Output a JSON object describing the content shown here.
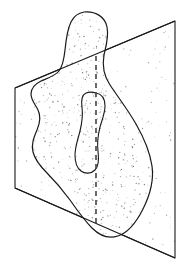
{
  "figure": {
    "title": "Irregular solid intersected by a cutting plane",
    "background_color": "#ffffff",
    "line_color": "#1a1a1a",
    "stipple_color": "#555555",
    "plane_fill": "#ffffff",
    "blob_fill": "#ffffff",
    "stroke_width": 1.1
  },
  "plane": {
    "name": "cutting-plane",
    "shape": "parallelogram",
    "corners": [
      {
        "label": "top-left",
        "x": 15,
        "y": 88
      },
      {
        "label": "top-right",
        "x": 175,
        "y": 21
      },
      {
        "label": "bottom-right",
        "x": 175,
        "y": 258
      },
      {
        "label": "bottom-left",
        "x": 15,
        "y": 188
      }
    ],
    "edges": [
      {
        "label": "top-edge",
        "from": "top-left",
        "to": "top-right"
      },
      {
        "label": "right-edge",
        "from": "top-right",
        "to": "bottom-right"
      },
      {
        "label": "bottom-edge",
        "from": "bottom-right",
        "to": "bottom-left"
      },
      {
        "label": "left-edge",
        "from": "bottom-left",
        "to": "top-left"
      }
    ]
  },
  "blob": {
    "name": "irregular-solid",
    "outline_path": "M 84 12 C 96 11 105 17 107 27 C 109 37 106 46 104 55 C 102 66 104 76 110 85 C 118 97 128 110 136 124 C 144 138 150 152 152 166 C 154 180 150 195 143 209 C 136 223 127 233 118 236 C 109 239 100 236 92 228 C 84 220 77 210 70 200 C 62 189 54 180 47 173 C 40 166 35 160 33 152 C 31 144 34 137 37 130 C 40 123 41 116 38 110 C 35 104 31 100 31 94 C 31 88 35 84 41 81 C 48 78 55 76 59 71 C 63 66 64 59 65 50 C 66 40 67 30 71 22 C 74 16 78 13 84 12 Z",
    "hole": {
      "name": "interior-hole",
      "path": "M 96 93 C 102 94 105 99 105 106 C 105 113 102 120 100 127 C 98 135 97 143 98 151 C 99 159 99 166 95 170 C 91 174 85 174 81 171 C 77 168 75 162 75 155 C 75 147 78 139 80 131 C 82 123 83 115 82 107 C 81 100 82 95 86 93 C 89 92 93 92 96 93 Z"
    }
  },
  "intersection_line": {
    "name": "plane-blob-intersection",
    "style": "dashed",
    "dash_pattern": "5,4",
    "from": {
      "x": 96,
      "y": 56
    },
    "to": {
      "x": 96,
      "y": 226
    }
  },
  "stipple": {
    "name": "shading-dots",
    "description": "Random stipple dots shade the blob surface and the visible portion of the plane",
    "blob_dot_count": 900,
    "plane_dot_count": 260,
    "dot_radius": 0.55
  }
}
